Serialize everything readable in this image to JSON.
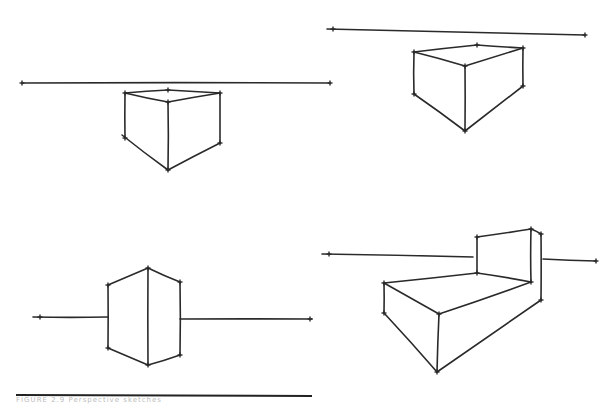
{
  "image": {
    "description": "Hand-drawn two-point perspective sketches of boxes with horizon lines",
    "background": "#ffffff",
    "ink_color": "#2a2a2a"
  },
  "sketches": [
    {
      "name": "box-below-horizon-left",
      "horizon": [
        [
          22,
          83
        ],
        [
          330,
          83
        ]
      ],
      "edges": [
        [
          [
            125,
            93
          ],
          [
            168,
            90
          ]
        ],
        [
          [
            168,
            90
          ],
          [
            220,
            93
          ]
        ],
        [
          [
            125,
            93
          ],
          [
            168,
            102
          ]
        ],
        [
          [
            168,
            102
          ],
          [
            220,
            93
          ]
        ],
        [
          [
            125,
            93
          ],
          [
            125,
            138
          ]
        ],
        [
          [
            168,
            102
          ],
          [
            168,
            170
          ]
        ],
        [
          [
            220,
            93
          ],
          [
            220,
            143
          ]
        ],
        [
          [
            122,
            135
          ],
          [
            168,
            170
          ]
        ],
        [
          [
            168,
            170
          ],
          [
            220,
            143
          ]
        ]
      ],
      "vertices": [
        [
          125,
          93
        ],
        [
          168,
          90
        ],
        [
          220,
          93
        ],
        [
          168,
          102
        ],
        [
          125,
          138
        ],
        [
          168,
          170
        ],
        [
          220,
          143
        ],
        [
          22,
          83
        ],
        [
          330,
          83
        ]
      ]
    },
    {
      "name": "box-below-horizon-right",
      "horizon": [
        [
          327,
          29
        ],
        [
          585,
          35
        ]
      ],
      "edges": [
        [
          [
            414,
            52
          ],
          [
            477,
            45
          ]
        ],
        [
          [
            477,
            45
          ],
          [
            523,
            48
          ]
        ],
        [
          [
            414,
            52
          ],
          [
            465,
            66
          ]
        ],
        [
          [
            465,
            66
          ],
          [
            523,
            48
          ]
        ],
        [
          [
            414,
            52
          ],
          [
            414,
            94
          ]
        ],
        [
          [
            465,
            66
          ],
          [
            465,
            131
          ]
        ],
        [
          [
            523,
            48
          ],
          [
            523,
            86
          ]
        ],
        [
          [
            414,
            94
          ],
          [
            465,
            131
          ]
        ],
        [
          [
            465,
            131
          ],
          [
            523,
            86
          ]
        ]
      ],
      "vertices": [
        [
          414,
          52
        ],
        [
          477,
          45
        ],
        [
          523,
          48
        ],
        [
          465,
          66
        ],
        [
          414,
          94
        ],
        [
          465,
          131
        ],
        [
          523,
          86
        ],
        [
          333,
          29
        ],
        [
          585,
          35
        ]
      ]
    },
    {
      "name": "box-on-horizon",
      "horizon_segments": [
        [
          [
            33,
            317
          ],
          [
            108,
            317
          ]
        ],
        [
          [
            180,
            319
          ],
          [
            312,
            319
          ]
        ]
      ],
      "edges": [
        [
          [
            108,
            285
          ],
          [
            148,
            268
          ]
        ],
        [
          [
            148,
            268
          ],
          [
            180,
            282
          ]
        ],
        [
          [
            108,
            285
          ],
          [
            108,
            348
          ]
        ],
        [
          [
            148,
            268
          ],
          [
            148,
            365
          ]
        ],
        [
          [
            180,
            282
          ],
          [
            180,
            355
          ]
        ],
        [
          [
            108,
            348
          ],
          [
            148,
            365
          ]
        ],
        [
          [
            148,
            365
          ],
          [
            180,
            355
          ]
        ]
      ],
      "vertices": [
        [
          108,
          285
        ],
        [
          148,
          268
        ],
        [
          180,
          282
        ],
        [
          108,
          348
        ],
        [
          148,
          365
        ],
        [
          180,
          355
        ],
        [
          40,
          317
        ],
        [
          310,
          319
        ]
      ]
    },
    {
      "name": "chair-shape",
      "horizon_segments": [
        [
          [
            322,
            254
          ],
          [
            473,
            257
          ]
        ],
        [
          [
            543,
            259
          ],
          [
            596,
            261
          ]
        ]
      ],
      "edges": [
        [
          [
            477,
            237
          ],
          [
            531,
            229
          ]
        ],
        [
          [
            531,
            229
          ],
          [
            541,
            234
          ]
        ],
        [
          [
            477,
            237
          ],
          [
            477,
            273
          ]
        ],
        [
          [
            531,
            229
          ],
          [
            531,
            282
          ]
        ],
        [
          [
            541,
            234
          ],
          [
            541,
            300
          ]
        ],
        [
          [
            384,
            283
          ],
          [
            477,
            273
          ]
        ],
        [
          [
            477,
            273
          ],
          [
            531,
            282
          ]
        ],
        [
          [
            384,
            283
          ],
          [
            439,
            314
          ]
        ],
        [
          [
            439,
            314
          ],
          [
            531,
            282
          ]
        ],
        [
          [
            384,
            283
          ],
          [
            384,
            313
          ]
        ],
        [
          [
            439,
            314
          ],
          [
            437,
            372
          ]
        ],
        [
          [
            384,
            313
          ],
          [
            437,
            372
          ]
        ],
        [
          [
            437,
            372
          ],
          [
            541,
            300
          ]
        ]
      ],
      "vertices": [
        [
          477,
          237
        ],
        [
          531,
          229
        ],
        [
          541,
          234
        ],
        [
          477,
          273
        ],
        [
          531,
          282
        ],
        [
          384,
          283
        ],
        [
          439,
          314
        ],
        [
          384,
          313
        ],
        [
          437,
          372
        ],
        [
          541,
          300
        ],
        [
          329,
          254
        ],
        [
          596,
          261
        ]
      ]
    }
  ],
  "footer": {
    "rule": [
      [
        16,
        395
      ],
      [
        312,
        396
      ]
    ],
    "caption": "FIGURE 2.9 Perspective sketches"
  }
}
